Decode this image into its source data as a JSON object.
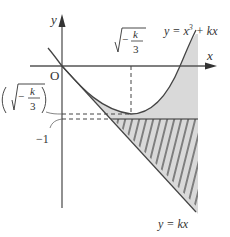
{
  "diagram": {
    "type": "function-graph",
    "axes": {
      "x_label": "x",
      "y_label": "y",
      "origin_label": "O"
    },
    "curve": {
      "label_prefix": "y = x",
      "label_exp": "3",
      "label_suffix": " + kx"
    },
    "line": {
      "label": "y = kx"
    },
    "annotations": {
      "x_min_label_num": "k",
      "x_min_label_den": "3",
      "x_min_label_sign": "−",
      "y_min_label_num": "k",
      "y_min_label_den": "3",
      "y_min_label_sign": "−",
      "minus_one_label": "−1"
    },
    "colors": {
      "axis": "#555555",
      "curve": "#444444",
      "shade": "#d9d9d9",
      "hatch": "#333333",
      "text": "#333333"
    }
  }
}
